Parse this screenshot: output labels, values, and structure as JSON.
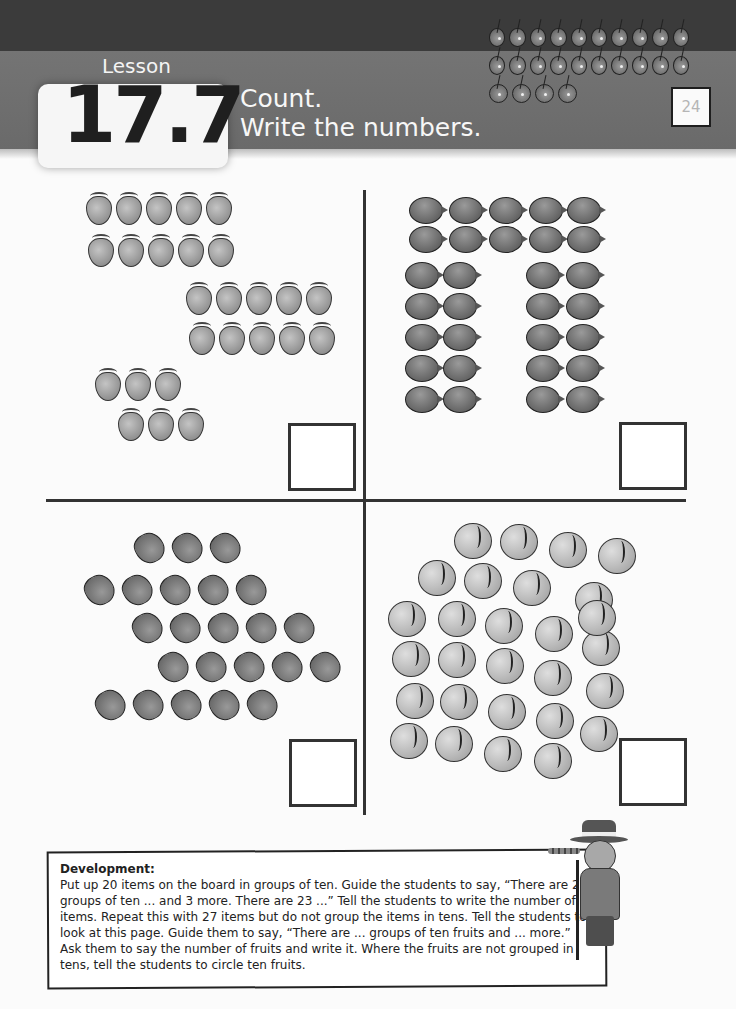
{
  "header": {
    "lesson_label": "Lesson",
    "lesson_number": "17.7",
    "title_line1": "Count.",
    "title_line2": "Write the numbers.",
    "page_number": "24",
    "cherry_rows": [
      10,
      10,
      4
    ],
    "colors": {
      "top_band": "#3b3b3b",
      "title_band": "#707070",
      "badge_bg": "#f6f6f6"
    }
  },
  "exercises": [
    {
      "quadrant": "top-left",
      "fruit": "strawberry",
      "count": 26,
      "grouping": "two groups of ten and 6 more",
      "answer": ""
    },
    {
      "quadrant": "top-right",
      "fruit": "plum",
      "count": 30,
      "grouping": "three groups of ten",
      "answer": ""
    },
    {
      "quadrant": "bottom-left",
      "fruit": "fig",
      "count": 23,
      "grouping": "not grouped in tens",
      "answer": ""
    },
    {
      "quadrant": "bottom-right",
      "fruit": "peach",
      "count": 28,
      "grouping": "not grouped in tens",
      "answer": ""
    }
  ],
  "development": {
    "title": "Development:",
    "body": "Put up 20 items on the board in groups of ten. Guide the students to say, “There are 2 groups of ten ... and 3 more. There are 23 ...” Tell the students to write the number of items. Repeat this with 27 items but do not group the items in tens. Tell the students to look at this page. Guide them to say,  “There are ... groups of ten fruits and ... more.” Ask them to say the number of fruits and write it. Where the fruits are not grouped in tens, tell the students to circle ten fruits."
  }
}
